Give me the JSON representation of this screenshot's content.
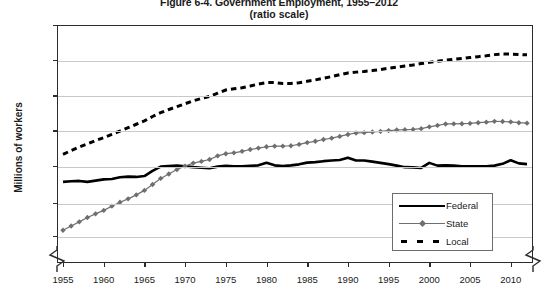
{
  "chart": {
    "title": "Figure 6-4. Government Employment, 1955–2012",
    "subtitle": "(ratio scale)",
    "ylabel": "Millions of workers"
  },
  "chart_data": {
    "type": "line",
    "title": "Figure 6-4. Government Employment, 1955–2012",
    "subtitle": "(ratio scale)",
    "xlabel": "",
    "ylabel": "Millions of workers",
    "yscale": "log",
    "ylim": [
      1.0,
      20.1
    ],
    "xlim": [
      1955,
      2012
    ],
    "grid": true,
    "legend_position": "inside-lower-right",
    "axis_break": true,
    "ytick_labels": [
      "20.1",
      "12.2",
      "7.4",
      "4.5",
      "2.7",
      "1.6",
      "1.0"
    ],
    "ytick_values": [
      20.1,
      12.2,
      7.4,
      4.5,
      2.7,
      1.6,
      1.0
    ],
    "xtick_labels": [
      "1955",
      "1960",
      "1965",
      "1970",
      "1975",
      "1980",
      "1985",
      "1990",
      "1995",
      "2000",
      "2005",
      "2010"
    ],
    "xtick_values": [
      1955,
      1960,
      1965,
      1970,
      1975,
      1980,
      1985,
      1990,
      1995,
      2000,
      2005,
      2010
    ],
    "x": [
      1955,
      1956,
      1957,
      1958,
      1959,
      1960,
      1961,
      1962,
      1963,
      1964,
      1965,
      1966,
      1967,
      1968,
      1969,
      1970,
      1971,
      1972,
      1973,
      1974,
      1975,
      1976,
      1977,
      1978,
      1979,
      1980,
      1981,
      1982,
      1983,
      1984,
      1985,
      1986,
      1987,
      1988,
      1989,
      1990,
      1991,
      1992,
      1993,
      1994,
      1995,
      1996,
      1997,
      1998,
      1999,
      2000,
      2001,
      2002,
      2003,
      2004,
      2005,
      2006,
      2007,
      2008,
      2009,
      2010,
      2011,
      2012
    ],
    "series": [
      {
        "name": "Federal",
        "color": "#000000",
        "style": "solid",
        "values": [
          2.19,
          2.21,
          2.22,
          2.19,
          2.23,
          2.27,
          2.28,
          2.34,
          2.36,
          2.35,
          2.38,
          2.56,
          2.72,
          2.74,
          2.76,
          2.73,
          2.7,
          2.68,
          2.66,
          2.72,
          2.75,
          2.73,
          2.73,
          2.75,
          2.77,
          2.87,
          2.77,
          2.74,
          2.77,
          2.81,
          2.88,
          2.9,
          2.94,
          2.97,
          2.99,
          3.09,
          2.97,
          2.97,
          2.92,
          2.87,
          2.82,
          2.76,
          2.7,
          2.69,
          2.67,
          2.87,
          2.76,
          2.77,
          2.76,
          2.73,
          2.73,
          2.73,
          2.73,
          2.76,
          2.83,
          2.98,
          2.85,
          2.82
        ]
      },
      {
        "name": "State",
        "color": "#6f6f6f",
        "style": "solid-marker",
        "marker": "diamond",
        "values": [
          1.1,
          1.17,
          1.24,
          1.32,
          1.39,
          1.46,
          1.55,
          1.64,
          1.72,
          1.82,
          1.94,
          2.11,
          2.3,
          2.45,
          2.61,
          2.74,
          2.86,
          2.93,
          3.01,
          3.17,
          3.27,
          3.31,
          3.38,
          3.47,
          3.54,
          3.61,
          3.64,
          3.64,
          3.66,
          3.73,
          3.83,
          3.9,
          4.0,
          4.08,
          4.18,
          4.3,
          4.39,
          4.41,
          4.45,
          4.49,
          4.54,
          4.58,
          4.6,
          4.62,
          4.67,
          4.79,
          4.89,
          4.99,
          5.0,
          5.01,
          5.03,
          5.08,
          5.12,
          5.18,
          5.17,
          5.14,
          5.08,
          5.05
        ]
      },
      {
        "name": "Local",
        "color": "#000000",
        "style": "dashed",
        "values": [
          3.24,
          3.42,
          3.6,
          3.76,
          3.94,
          4.11,
          4.31,
          4.51,
          4.73,
          4.97,
          5.21,
          5.55,
          5.86,
          6.13,
          6.39,
          6.65,
          6.94,
          7.17,
          7.38,
          7.73,
          8.09,
          8.23,
          8.36,
          8.56,
          8.81,
          9.0,
          8.99,
          8.87,
          8.87,
          8.98,
          9.15,
          9.34,
          9.55,
          9.79,
          10.06,
          10.31,
          10.43,
          10.53,
          10.66,
          10.82,
          11.04,
          11.19,
          11.37,
          11.55,
          11.78,
          11.98,
          12.19,
          12.39,
          12.52,
          12.66,
          12.83,
          13.0,
          13.17,
          13.38,
          13.51,
          13.47,
          13.4,
          13.34
        ]
      }
    ]
  },
  "legend": {
    "items": [
      {
        "label": "Federal",
        "style": "thick-solid"
      },
      {
        "label": "State",
        "style": "thin-marker"
      },
      {
        "label": "Local",
        "style": "thick-dashed"
      }
    ]
  }
}
